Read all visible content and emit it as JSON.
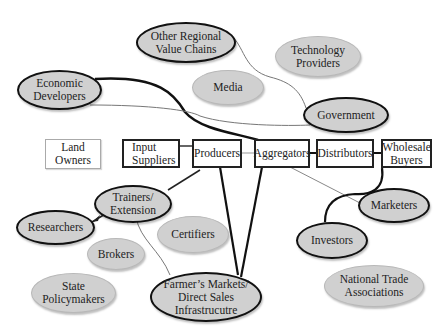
{
  "diagram": {
    "chain_boxes": [
      {
        "id": "input_suppliers",
        "label": "Input\nSuppliers"
      },
      {
        "id": "producers",
        "label": "Producers"
      },
      {
        "id": "aggregators",
        "label": "Aggregators"
      },
      {
        "id": "distributors",
        "label": "Distributors"
      },
      {
        "id": "wholesale_buyers",
        "label": "Wholesale\nBuyers"
      }
    ],
    "other_boxes": [
      {
        "id": "land_owners",
        "label": "Land\nOwners"
      }
    ],
    "connected_actors": [
      {
        "id": "economic_developers",
        "label": "Economic\nDevelopers"
      },
      {
        "id": "other_regional_value_chains",
        "label": "Other Regional\nValue Chains"
      },
      {
        "id": "government",
        "label": "Government"
      },
      {
        "id": "trainers_extension",
        "label": "Trainers/\nExtension"
      },
      {
        "id": "researchers",
        "label": "Researchers"
      },
      {
        "id": "farmers_markets",
        "label": "Farmer’s Markets/\nDirect Sales\nInfrastrucutre"
      },
      {
        "id": "marketers",
        "label": "Marketers"
      },
      {
        "id": "investors",
        "label": "Investors"
      }
    ],
    "unconnected_actors": [
      {
        "id": "technology_providers",
        "label": "Technology\nProviders"
      },
      {
        "id": "media",
        "label": "Media"
      },
      {
        "id": "certifiers",
        "label": "Certifiers"
      },
      {
        "id": "brokers",
        "label": "Brokers"
      },
      {
        "id": "state_policymakers",
        "label": "State\nPolicymakers"
      },
      {
        "id": "national_trade_associations",
        "label": "National Trade\nAssociations"
      }
    ],
    "colors": {
      "ellipse_fill": "#d0d0d0",
      "strong_link": "#111111",
      "weak_link": "#888888",
      "box_border": "#222222"
    }
  }
}
